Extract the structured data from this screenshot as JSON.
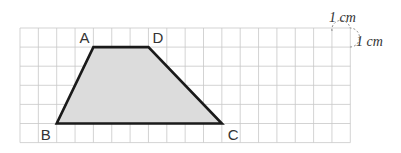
{
  "diagram": {
    "type": "trapezoid-on-grid",
    "grid": {
      "cols": 18,
      "rows": 6,
      "unit_label_top": "1 cm",
      "unit_label_side": "1 cm"
    },
    "vertices": [
      {
        "label": "A",
        "col": 4,
        "row": 1
      },
      {
        "label": "D",
        "col": 7,
        "row": 1
      },
      {
        "label": "C",
        "col": 11,
        "row": 5
      },
      {
        "label": "B",
        "col": 2,
        "row": 5
      }
    ],
    "colors": {
      "fill": "#dcdcdc",
      "stroke": "#1a1a1a",
      "grid": "#c8c8c8"
    }
  }
}
